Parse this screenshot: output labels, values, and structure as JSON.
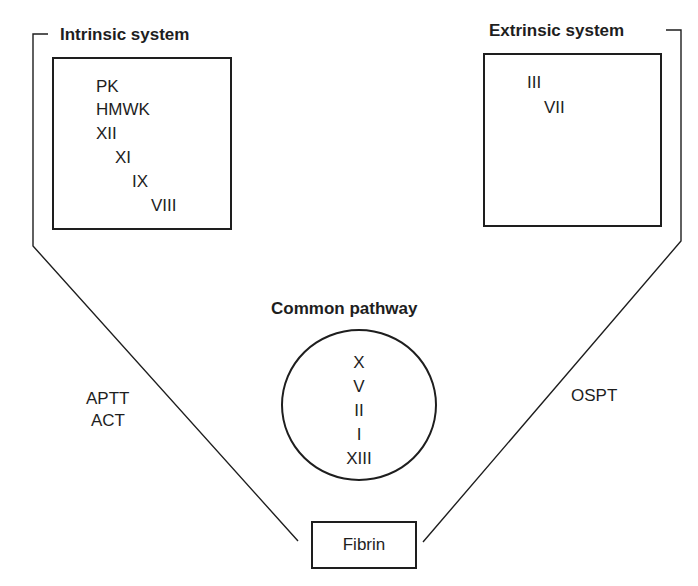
{
  "intrinsic": {
    "title": "Intrinsic system",
    "factors": [
      "PK",
      "HMWK",
      "XII",
      "XI",
      "IX",
      "VIII"
    ],
    "tests": [
      "APTT",
      "ACT"
    ]
  },
  "extrinsic": {
    "title": "Extrinsic system",
    "factors": [
      "III",
      "VII"
    ],
    "tests": [
      "OSPT"
    ]
  },
  "common": {
    "title": "Common pathway",
    "factors": [
      "X",
      "V",
      "II",
      "I",
      "XIII"
    ]
  },
  "product": {
    "label": "Fibrin"
  },
  "colors": {
    "line": "#1e1e1e",
    "background": "#ffffff"
  }
}
